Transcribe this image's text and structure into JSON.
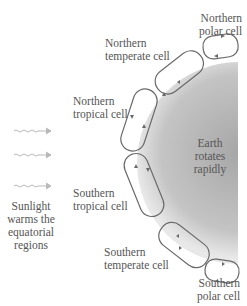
{
  "diagram": {
    "labels": {
      "northern_polar": [
        "Northern",
        "polar cell"
      ],
      "northern_temperate": [
        "Northern",
        "temperate cell"
      ],
      "northern_tropical": [
        "Northern",
        "tropical cell"
      ],
      "southern_tropical": [
        "Southern",
        "tropical cell"
      ],
      "southern_temperate": [
        "Southern",
        "temperate cell"
      ],
      "southern_polar": [
        "Southern",
        "polar cell"
      ],
      "earth": [
        "Earth",
        "rotates",
        "rapidly"
      ],
      "sunlight": [
        "Sunlight",
        "warms the",
        "equatorial",
        "regions"
      ]
    },
    "colors": {
      "earth_dark": "#a9a9a9",
      "earth_light": "#e4e4e4",
      "cell_stroke": "#6a6a6a",
      "sun_arrow": "#b9b9b9"
    }
  }
}
